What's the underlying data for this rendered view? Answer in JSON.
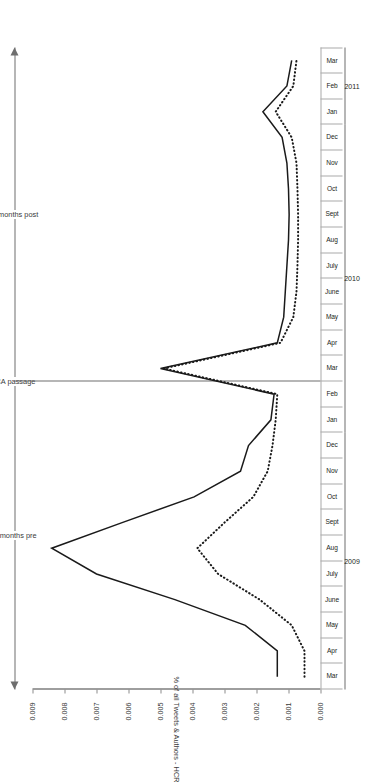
{
  "figure": {
    "y_axis_title": "% of all Tweets & Authors - HCR",
    "annotations": {
      "pre": "12 months pre",
      "marker": "ACA passage",
      "post": "12 months post"
    },
    "years": [
      {
        "label": "2009"
      },
      {
        "label": "2010"
      },
      {
        "label": "2011"
      }
    ],
    "legend": [
      {
        "label": "% of all Tweets - HCR",
        "style": "solid",
        "color": "#1a1a1a"
      },
      {
        "label": "% of all Authors - HCR",
        "style": "dotted",
        "color": "#1a1a1a"
      }
    ]
  },
  "chart_data": {
    "type": "line",
    "title": "",
    "xlabel": "",
    "ylabel": "% of all Tweets & Authors - HCR",
    "ylim": [
      0.0,
      0.009
    ],
    "ytick_labels": [
      "0.000",
      "0.001",
      "0.002",
      "0.003",
      "0.004",
      "0.005",
      "0.006",
      "0.007",
      "0.008",
      "0.009"
    ],
    "ytick_values": [
      0.0,
      0.001,
      0.002,
      0.003,
      0.004,
      0.005,
      0.006,
      0.007,
      0.008,
      0.009
    ],
    "grid": false,
    "legend_position": "bottom-right",
    "categories": [
      "Mar",
      "Apr",
      "May",
      "June",
      "July",
      "Aug",
      "Sept",
      "Oct",
      "Nov",
      "Dec",
      "Jan",
      "Feb",
      "Mar",
      "Apr",
      "May",
      "June",
      "July",
      "Aug",
      "Sept",
      "Oct",
      "Nov",
      "Dec",
      "Jan",
      "Feb",
      "Mar"
    ],
    "category_years": [
      "2009",
      "2009",
      "2009",
      "2009",
      "2009",
      "2009",
      "2009",
      "2009",
      "2009",
      "2009",
      "2010",
      "2010",
      "2010",
      "2010",
      "2010",
      "2010",
      "2010",
      "2010",
      "2010",
      "2010",
      "2010",
      "2010",
      "2011",
      "2011",
      "2011"
    ],
    "annotations": [
      {
        "text": "ACA passage",
        "at_category": "Mar",
        "at_index": 12,
        "type": "vline"
      },
      {
        "text": "12 months pre",
        "from_index": 0,
        "to_index": 12,
        "type": "span"
      },
      {
        "text": "12 months post",
        "from_index": 12,
        "to_index": 24,
        "type": "span"
      }
    ],
    "series": [
      {
        "name": "% of all Tweets - HCR",
        "style": "solid",
        "values": [
          0.00135,
          0.00135,
          0.00235,
          0.00455,
          0.007,
          0.0084,
          0.0062,
          0.00395,
          0.0025,
          0.00225,
          0.00155,
          0.00145,
          0.005,
          0.00135,
          0.00115,
          0.0011,
          0.00105,
          0.001,
          0.00098,
          0.001,
          0.00105,
          0.0012,
          0.0018,
          0.00105,
          0.0009
        ]
      },
      {
        "name": "% of all Authors - HCR",
        "style": "dotted",
        "values": [
          0.0005,
          0.0005,
          0.0009,
          0.0019,
          0.0032,
          0.00385,
          0.003,
          0.0021,
          0.00165,
          0.0015,
          0.0014,
          0.00135,
          0.0049,
          0.00125,
          0.00085,
          0.00075,
          0.00072,
          0.0007,
          0.0007,
          0.00072,
          0.00075,
          0.0009,
          0.0014,
          0.00085,
          0.00075
        ]
      }
    ]
  }
}
